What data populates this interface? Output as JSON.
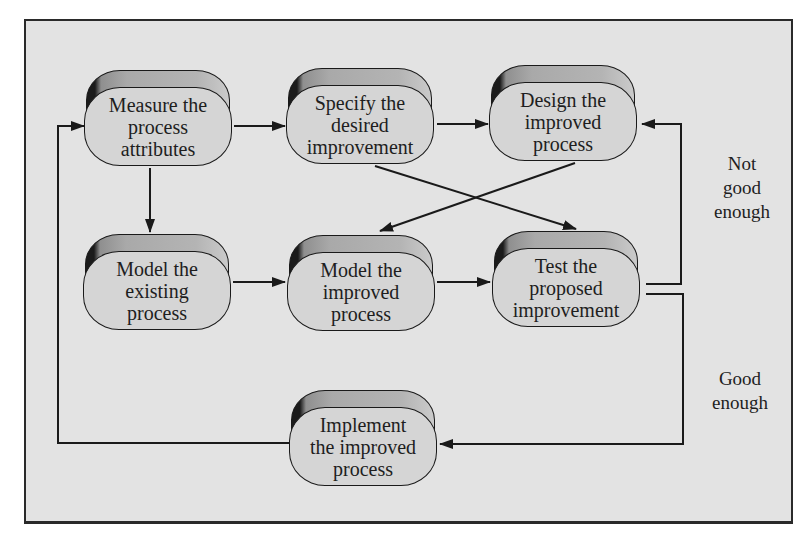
{
  "diagram": {
    "type": "process-flowchart",
    "nodes": [
      {
        "id": "measure",
        "label": "Measure the\nprocess\nattributes"
      },
      {
        "id": "specify",
        "label": "Specify the\ndesired\nimprovement"
      },
      {
        "id": "design",
        "label": "Design the\nimproved\nprocess"
      },
      {
        "id": "model_existing",
        "label": "Model the\nexisting\nprocess"
      },
      {
        "id": "model_improved",
        "label": "Model the\nimproved\nprocess"
      },
      {
        "id": "test",
        "label": "Test the\nproposed\nimprovement"
      },
      {
        "id": "implement",
        "label": "Implement\nthe improved\nprocess"
      }
    ],
    "edges": [
      {
        "from": "measure",
        "to": "specify",
        "label": ""
      },
      {
        "from": "specify",
        "to": "design",
        "label": ""
      },
      {
        "from": "measure",
        "to": "model_existing",
        "label": ""
      },
      {
        "from": "model_existing",
        "to": "model_improved",
        "label": ""
      },
      {
        "from": "model_improved",
        "to": "test",
        "label": ""
      },
      {
        "from": "specify",
        "to": "test",
        "label": ""
      },
      {
        "from": "design",
        "to": "model_improved",
        "label": ""
      },
      {
        "from": "test",
        "to": "design",
        "label": "Not good enough"
      },
      {
        "from": "test",
        "to": "implement",
        "label": "Good enough"
      },
      {
        "from": "implement",
        "to": "measure",
        "label": ""
      }
    ],
    "edge_labels": {
      "not_good_enough": "Not\ngood\nenough",
      "good_enough": "Good\nenough"
    },
    "colors": {
      "background": "#e3e3e3",
      "node_face": "#d5d5d5",
      "node_top": "#b0b0b0",
      "stroke": "#1a1a1a",
      "page": "#ffffff"
    }
  }
}
